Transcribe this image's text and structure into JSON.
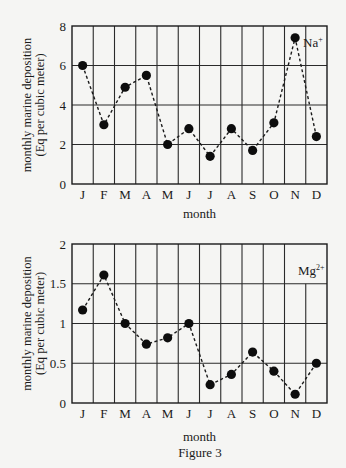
{
  "figure": {
    "caption": "Figure 3",
    "background": "#f5f5f3",
    "ink": "#1a1a1a",
    "grid_color": "#2a2a2a"
  },
  "chart_data": [
    {
      "type": "line",
      "title": "",
      "series_label": "Na",
      "series_label_sup": "+",
      "xlabel": "month",
      "ylabel_line1": "monthly marine deposition",
      "ylabel_line2": "(Eq per cubic meter)",
      "categories": [
        "J",
        "F",
        "M",
        "A",
        "M",
        "J",
        "J",
        "A",
        "S",
        "O",
        "N",
        "D"
      ],
      "values": [
        6.0,
        3.0,
        4.9,
        5.5,
        2.0,
        2.8,
        1.4,
        2.8,
        1.7,
        3.1,
        7.4,
        2.4
      ],
      "ylim": [
        0,
        8
      ],
      "yticks": [
        0,
        2,
        4,
        6,
        8
      ],
      "ytick_labels": [
        "0",
        "2",
        "4",
        "6",
        "8"
      ],
      "grid": true,
      "line_style": "dashed",
      "marker": "filled-circle",
      "legend_position": "top-right"
    },
    {
      "type": "line",
      "title": "",
      "series_label": "Mg",
      "series_label_sup": "2+",
      "xlabel": "month",
      "ylabel_line1": "monthly marine deposition",
      "ylabel_line2": "(Eq per cubic meter)",
      "categories": [
        "J",
        "F",
        "M",
        "A",
        "M",
        "J",
        "J",
        "A",
        "S",
        "O",
        "N",
        "D"
      ],
      "values": [
        1.17,
        1.61,
        1.0,
        0.74,
        0.82,
        1.0,
        0.23,
        0.36,
        0.64,
        0.4,
        0.11,
        0.5
      ],
      "ylim": [
        0,
        2
      ],
      "yticks": [
        0,
        0.5,
        1,
        1.5,
        2
      ],
      "ytick_labels": [
        "0",
        "0.5",
        "1",
        "1.5",
        "2"
      ],
      "grid": true,
      "line_style": "dashed",
      "marker": "filled-circle",
      "legend_position": "top-right"
    }
  ]
}
